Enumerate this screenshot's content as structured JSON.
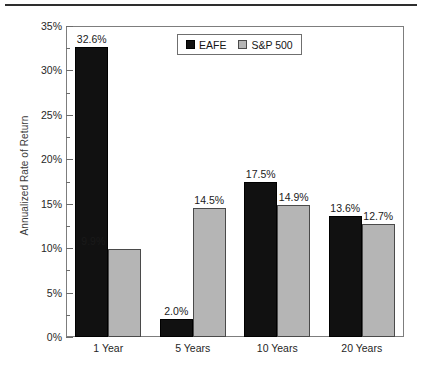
{
  "chart_data": {
    "type": "bar",
    "title": "",
    "xlabel": "",
    "ylabel": "Annualized Rate of Return",
    "categories": [
      "1 Year",
      "5 Years",
      "10 Years",
      "20 Years"
    ],
    "series": [
      {
        "name": "EAFE",
        "color": "#111111",
        "values": [
          32.6,
          2.0,
          17.5,
          13.6
        ]
      },
      {
        "name": "S&P 500",
        "color": "#b5b5b5",
        "values": [
          9.9,
          14.5,
          14.9,
          12.7
        ]
      }
    ],
    "value_labels": {
      "EAFE": [
        "32.6%",
        "2.0%",
        "17.5%",
        "13.6%"
      ],
      "S&P 500": [
        "9.9%",
        "14.5%",
        "14.9%",
        "12.7%"
      ]
    },
    "ylim": [
      0,
      35
    ],
    "ytick_values": [
      0,
      5,
      10,
      15,
      20,
      25,
      30,
      35
    ],
    "ytick_labels": [
      "0%",
      "5%",
      "10%",
      "15%",
      "20%",
      "25%",
      "30%",
      "35%"
    ],
    "yminor_step": 2.5,
    "grid": false,
    "legend_position": "top-center",
    "legend_entries": [
      "EAFE",
      "S&P 500"
    ]
  },
  "legend": {
    "entries": [
      {
        "label": "EAFE",
        "swatch": "black-square-icon"
      },
      {
        "label": "S&P 500",
        "swatch": "gray-square-icon"
      }
    ]
  },
  "axes": {
    "y_title": "Annualized Rate of Return"
  }
}
